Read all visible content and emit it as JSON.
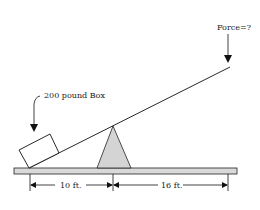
{
  "diagram": {
    "type": "lever",
    "force_label": "Force=?",
    "box_label": "200 pound Box",
    "left_distance_label": "10 ft.",
    "right_distance_label": "16 ft.",
    "colors": {
      "line": "#111111",
      "plank_fill": "#d9d9d9",
      "fulcrum_fill": "#d4d4d4"
    }
  }
}
